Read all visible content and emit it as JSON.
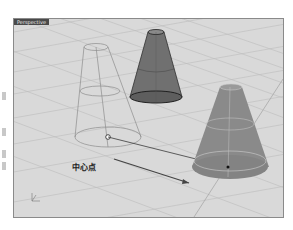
{
  "viewport": {
    "tab_label": "Perspective",
    "background": "#d9d9d9",
    "grid_color": "#bdbdbd"
  },
  "annotations": {
    "center_point_label": "中心点"
  },
  "objects": [
    {
      "name": "solid-truncated-cone",
      "shading": "shaded",
      "color": "#6e6e6e"
    },
    {
      "name": "wireframe-truncated-cone",
      "shading": "wireframe",
      "color": "#8c8c8c"
    },
    {
      "name": "moved-truncated-cone",
      "shading": "ghosted",
      "color": "#8a8a8a"
    }
  ],
  "axis_icon": "xyz-axis-icon"
}
